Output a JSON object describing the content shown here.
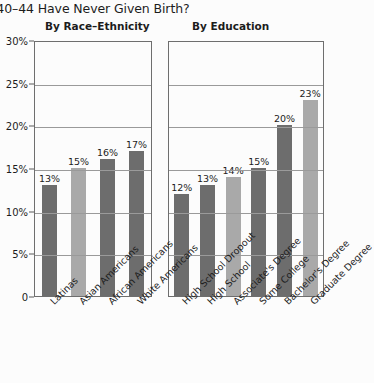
{
  "title": "s 40–44 Have Never Given Birth?",
  "axis": {
    "ticks": [
      "30%",
      "25%",
      "20%",
      "15%",
      "10%",
      "5%",
      "0"
    ],
    "values": [
      30,
      25,
      20,
      15,
      10,
      5,
      0
    ],
    "max": 30
  },
  "panels": [
    {
      "id": "race",
      "header": "By Race–Ethnicity",
      "bars": [
        {
          "label": "Latinas",
          "value": 13,
          "display": "13%",
          "shade": "dark"
        },
        {
          "label": "Asian Americans",
          "value": 15,
          "display": "15%",
          "shade": "light"
        },
        {
          "label": "African Americans",
          "value": 16,
          "display": "16%",
          "shade": "dark"
        },
        {
          "label": "White Americans",
          "value": 17,
          "display": "17%",
          "shade": "dark"
        }
      ]
    },
    {
      "id": "edu",
      "header": "By Education",
      "bars": [
        {
          "label": "High School Dropout",
          "value": 12,
          "display": "12%",
          "shade": "dark"
        },
        {
          "label": "High School",
          "value": 13,
          "display": "13%",
          "shade": "dark"
        },
        {
          "label": "Associate's Degree",
          "value": 14,
          "display": "14%",
          "shade": "light"
        },
        {
          "label": "Some College",
          "value": 15,
          "display": "15%",
          "shade": "dark"
        },
        {
          "label": "Bachelor's Degree",
          "value": 20,
          "display": "20%",
          "shade": "dark"
        },
        {
          "label": "Graduate Degree",
          "value": 23,
          "display": "23%",
          "shade": "light"
        }
      ]
    }
  ],
  "colors": {
    "bar_dark": "#6d6d6d",
    "bar_light": "#a9a9a9",
    "axis": "#6e6e6e",
    "grid": "#9a9a9a",
    "background": "#fcfcfc",
    "text": "#1c1c1c"
  },
  "chart_data": {
    "type": "bar",
    "title": "s 40–44 Have Never Given Birth?",
    "xlabel": "",
    "ylabel": "",
    "ylim": [
      0,
      30
    ],
    "ytick_labels": [
      "0",
      "5%",
      "10%",
      "15%",
      "20%",
      "25%",
      "30%"
    ],
    "ytick_values": [
      0,
      5,
      10,
      15,
      20,
      25,
      30
    ],
    "grid": true,
    "legend": "none",
    "panels": [
      {
        "title": "By Race–Ethnicity",
        "categories": [
          "Latinas",
          "Asian Americans",
          "African Americans",
          "White Americans"
        ],
        "values": [
          13,
          15,
          16,
          17
        ],
        "data_labels": [
          "13%",
          "15%",
          "16%",
          "17%"
        ]
      },
      {
        "title": "By Education",
        "categories": [
          "High School Dropout",
          "High School",
          "Associate's Degree",
          "Some College",
          "Bachelor's Degree",
          "Graduate Degree"
        ],
        "values": [
          12,
          13,
          14,
          15,
          20,
          23
        ],
        "data_labels": [
          "12%",
          "13%",
          "14%",
          "15%",
          "20%",
          "23%"
        ]
      }
    ]
  }
}
